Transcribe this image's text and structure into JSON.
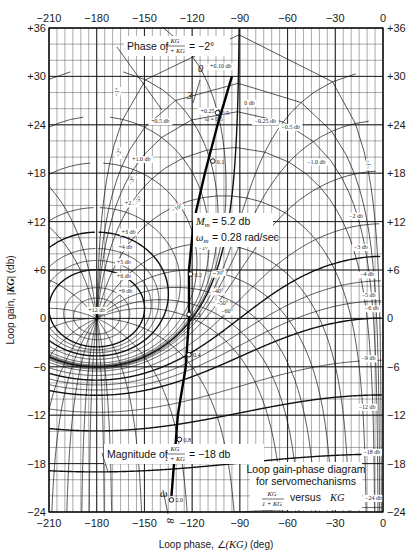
{
  "chart_data": {
    "type": "line",
    "title": "Loop gain-phase diagram for servomechanisms",
    "subtitle": "KG/(1 + KG) versus KG",
    "xlabel": "Loop phase, ∠(KG) (deg)",
    "ylabel": "Loop gain, |KG| (db)",
    "xlim": [
      -210,
      0
    ],
    "ylim": [
      -24,
      36
    ],
    "x_ticks": [
      -210,
      -180,
      -150,
      -120,
      -90,
      -60,
      -30,
      0
    ],
    "x_tick_labels": [
      "−210",
      "−180",
      "−150",
      "−120",
      "−90",
      "−60",
      "−30",
      "0"
    ],
    "y_ticks": [
      36,
      30,
      24,
      18,
      12,
      6,
      0,
      -6,
      -12,
      -18,
      -24
    ],
    "y_tick_labels": [
      "+36",
      "+30",
      "+24",
      "+18",
      "+12",
      "+6",
      "0",
      "−6",
      "−12",
      "−18",
      "−24"
    ],
    "grid": true,
    "grid_minor_x_deg": 5,
    "grid_minor_y_db": 1,
    "closed_loop_magnitude_contours_db": [
      12,
      9,
      6,
      5,
      4,
      3,
      2,
      1.0,
      0.5,
      0.25,
      0.1,
      0,
      -0.25,
      -0.5,
      -1.0,
      -2,
      -3,
      -4,
      -5,
      -6,
      -9,
      -12,
      -18,
      -24
    ],
    "closed_loop_magnitude_labels": [
      "+12 db",
      "+9 db",
      "+6 db",
      "+5 db",
      "+4 db",
      "+3 db",
      "+2 db",
      "+1.0 db",
      "+0.5 db",
      "+0.25 db",
      "+0.10 db",
      "0 db",
      "−0.25 db",
      "−0.5 db",
      "−1.0 db",
      "−2 db",
      "−3 db",
      "−4 db",
      "−5 db",
      "−6 db",
      "−9 db",
      "−12 db",
      "−18 db",
      "−24 db"
    ],
    "closed_loop_phase_contours_deg": [
      -1,
      -2,
      -3,
      -5,
      -10,
      -20,
      -30,
      -40,
      -50,
      -60,
      -90,
      -120,
      -150,
      -170,
      -175,
      -185,
      -190,
      -200,
      -210,
      -220,
      -240,
      -270,
      -300,
      -330,
      -350,
      -355
    ],
    "series": [
      {
        "name": "KG frequency locus",
        "x_phase_deg": [
          -95,
          -104,
          -112,
          -119,
          -122,
          -122,
          -124,
          -129,
          -133
        ],
        "y_gain_db": [
          30,
          24,
          18,
          12,
          6,
          0,
          -6,
          -12,
          -22
        ],
        "frequency_markers": [
          {
            "omega": "0.1",
            "x": -107,
            "y": 19.5
          },
          {
            "omega": "0.2",
            "x": -121,
            "y": 5.5
          },
          {
            "omega": "0.3",
            "x": -122,
            "y": 0.5
          },
          {
            "omega": "0.4",
            "x": -122,
            "y": -4.5
          },
          {
            "omega": "0.5",
            "x": -104,
            "y": 25.5
          },
          {
            "omega": "0.8",
            "x": -128,
            "y": -15
          },
          {
            "omega": "2.0",
            "x": -133,
            "y": -22.5
          }
        ]
      }
    ],
    "annotations": [
      {
        "text": "Phase of KG/(1 + KG) = −2°"
      },
      {
        "text": "ω = 0.5"
      },
      {
        "text": "M_m = 5.2 db"
      },
      {
        "text": "ω_m = 0.28 rad/sec"
      },
      {
        "text": "Magnitude of KG/(1 + KG) = −18 db"
      },
      {
        "text": "ω → 0 (top)"
      },
      {
        "text": "ω → ∞ (bottom)"
      }
    ],
    "legend_position": "bottom-right box"
  },
  "labels": {
    "xlabel_prefix": "Loop phase,",
    "xlabel_suffix": "(deg)",
    "ylabel": "Loop gain,",
    "ylabel_unit": "(db)",
    "phase_annot": "Phase of",
    "phase_annot_val": "= −2°",
    "frac_num": "KG",
    "frac_den": "1 + KG",
    "mag_annot": "Magnitude of",
    "mag_annot_val": "= −18 db",
    "mm": "= 5.2 db",
    "wm": "= 0.28 rad/sec",
    "title_box_1": "Loop gain-phase diagram",
    "title_box_2": "for servomechanisms",
    "title_box_3": "versus",
    "omega_half": "ω = 0.5",
    "zero": "0",
    "three": "3",
    "infinity": "8"
  }
}
